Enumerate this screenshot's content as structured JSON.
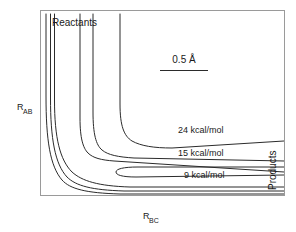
{
  "figure": {
    "background_color": "#ffffff",
    "frame_color": "#9a9a9a",
    "contour_color": "#2b2b2b",
    "reactants_label": "Reactants",
    "products_label": "Products",
    "scale_label": "0.5 Å"
  },
  "axes": {
    "y_axis_base": "R",
    "y_axis_sub": "AB",
    "x_axis_base": "R",
    "x_axis_sub": "BC"
  },
  "chart_data": {
    "type": "line",
    "title": "",
    "subtitle": "",
    "xlabel": "R_BC",
    "ylabel": "R_AB",
    "grid": false,
    "legend_position": "inline-annotations",
    "plot_frame": {
      "x": 40,
      "y": 10,
      "width": 245,
      "height": 186
    },
    "annotations": [
      {
        "text": "Reactants",
        "x": 52,
        "y": 26,
        "anchor": "start"
      },
      {
        "text": "Products",
        "x": 276,
        "y": 190,
        "anchor": "start",
        "rotation": -90
      },
      {
        "text": "0.5 Å",
        "x": 184,
        "y": 63,
        "anchor": "middle"
      },
      {
        "text": "24 kcal/mol",
        "x": 178,
        "y": 133,
        "anchor": "start"
      },
      {
        "text": "15 kcal/mol",
        "x": 178,
        "y": 156,
        "anchor": "start"
      },
      {
        "text": "9 kcal/mol",
        "x": 184,
        "y": 178,
        "anchor": "start"
      }
    ],
    "scale_bar": {
      "x1": 160,
      "x2": 208,
      "y": 70,
      "value": 0.5,
      "unit": "Å"
    },
    "contour_levels": [
      {
        "label": "24 kcal/mol",
        "value": 24,
        "unit": "kcal/mol"
      },
      {
        "label": "15 kcal/mol",
        "value": 15,
        "unit": "kcal/mol"
      },
      {
        "label": "9 kcal/mol",
        "value": 9,
        "unit": "kcal/mol"
      }
    ],
    "series": [
      {
        "name": "contour-outermost-left-a",
        "path": "M 46,14 L 46,96 C 46,140 50,166 62,180 C 70,189 86,193 120,194 L 284,194"
      },
      {
        "name": "contour-outermost-left-b",
        "path": "M 50.5,14 L 50.5,98 C 50.5,139 55,164 67,177 C 76,186 92,190 124,191 L 284,191"
      },
      {
        "name": "contour-outermost-left-c",
        "path": "M 54.5,14 L 54.5,100 C 54.5,138 60,160 72,172 C 82,181 98,186 130,187 L 284,187"
      },
      {
        "name": "contour-9-kcal",
        "path": "M 80,14 L 80,118 C 80,138 83,148 88,153 C 93,158 101,160 114,161 L 284,172"
      },
      {
        "name": "contour-9-kcal-inner-loop",
        "path": "M 284,175 L 136,177 C 122,177 116,175 116,172 C 116,169 123,167 138,167 L 284,167"
      },
      {
        "name": "contour-15-kcal",
        "path": "M 93,14 L 93,112 C 93,134 96,145 102,150 C 108,155 118,157 134,158 L 284,161"
      },
      {
        "name": "contour-24-kcal",
        "path": "M 120,14 L 120,104 C 120,126 124,136 132,141 C 141,146 154,148 172,148 L 284,141"
      }
    ]
  }
}
